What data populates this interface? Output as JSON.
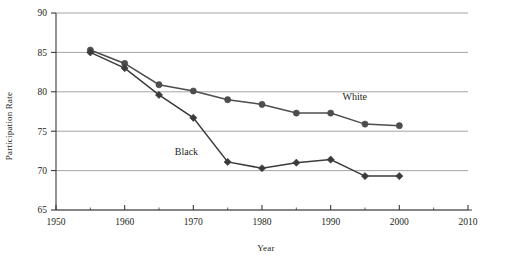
{
  "chart_data": {
    "type": "line",
    "title": "",
    "subtitle": "",
    "xlabel": "Year",
    "ylabel": "Participation Rate",
    "x": [
      1955,
      1960,
      1965,
      1970,
      1975,
      1980,
      1985,
      1990,
      1995,
      2000
    ],
    "xlim": [
      1950,
      2010
    ],
    "ylim": [
      65,
      90
    ],
    "xticks": [
      1950,
      1960,
      1970,
      1980,
      1990,
      2000,
      2010
    ],
    "xtick_labels": [
      "1950",
      "1960",
      "1970",
      "1980",
      "1990",
      "2000",
      "2010"
    ],
    "xminor_ticks": [
      1955,
      1965,
      1975,
      1985,
      1995,
      2005
    ],
    "yticks": [
      65,
      70,
      75,
      80,
      85,
      90
    ],
    "ytick_labels": [
      "65",
      "70",
      "75",
      "80",
      "85",
      "90"
    ],
    "grid": "horizontal",
    "legend_position": "inline-annotations",
    "series": [
      {
        "name": "White",
        "label": "White",
        "marker": "circle",
        "color": "#4d4d4d",
        "annotation": {
          "text": "White",
          "x": 1993.5,
          "y": 78.9
        },
        "values": [
          85.3,
          83.6,
          80.9,
          80.1,
          79.0,
          78.4,
          77.3,
          77.3,
          75.9,
          75.7
        ]
      },
      {
        "name": "Black",
        "label": "Black",
        "marker": "diamond",
        "color": "#3b3b3b",
        "annotation": {
          "text": "Black",
          "x": 1969.0,
          "y": 72.0
        },
        "values": [
          85.0,
          83.0,
          79.6,
          76.7,
          71.1,
          70.3,
          71.0,
          71.4,
          69.3,
          69.3
        ]
      }
    ]
  },
  "style": {
    "grid_color": "#9a9a9a",
    "axis_color": "#3a3a3a",
    "plot_background": "#ffffff",
    "text_color": "#231f20"
  }
}
